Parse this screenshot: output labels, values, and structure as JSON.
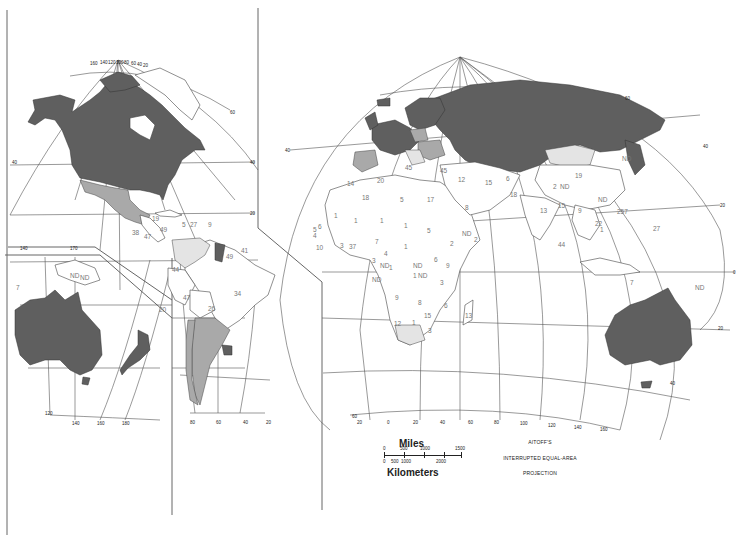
{
  "map": {
    "title_lines": [
      "AITOFF'S",
      "INTERRUPTED EQUAL-AREA",
      "PROJECTION"
    ],
    "scale": {
      "miles_label": "Miles",
      "miles_ticks": [
        "0",
        "500",
        "1000",
        "1500"
      ],
      "km_label": "Kilometers",
      "km_ticks": [
        "0",
        "500",
        "1000",
        "2000"
      ]
    },
    "shading_colors": {
      "dark": "#5f5f5f",
      "medium": "#a9a9a9",
      "light": "#e4e4e4",
      "none": "#ffffff"
    },
    "grid_labels": {
      "americas_top": [
        "160",
        "140",
        "120",
        "100",
        "80",
        "60",
        "40",
        "20"
      ],
      "americas_lat": [
        "60",
        "40",
        "20",
        "0",
        "20",
        "40"
      ],
      "pacific_bottom": [
        "120",
        "140",
        "160",
        "180"
      ],
      "south_america_bottom": [
        "80",
        "60",
        "40",
        "20"
      ],
      "pacific_top": [
        "140",
        "170"
      ],
      "eurasia_bottom": [
        "20",
        "0",
        "20",
        "40",
        "60",
        "80",
        "100",
        "120",
        "140",
        "160"
      ],
      "eurasia_lat": [
        "60",
        "40",
        "20",
        "0",
        "20",
        "40",
        "60"
      ]
    },
    "region_values": {
      "central_america": [
        "19",
        "5",
        "27",
        "9",
        "38",
        "47",
        "49",
        "41",
        "49"
      ],
      "south_america": [
        "44",
        "47",
        "34",
        "26",
        "20"
      ],
      "oceania": [
        "7",
        "ND",
        "ND",
        "20"
      ],
      "europe_med": [
        "45",
        "45",
        "20",
        "14",
        "12",
        "15"
      ],
      "north_africa": [
        "18",
        "5",
        "17",
        "8",
        "1",
        "1",
        "1",
        "1",
        "5",
        "7",
        "1"
      ],
      "west_africa": [
        "5",
        "6",
        "4",
        "10",
        "3",
        "37",
        "3",
        "4",
        "ND",
        "1",
        "ND"
      ],
      "east_africa": [
        "2",
        "ND",
        "2",
        "6",
        "9",
        "ND",
        "1",
        "ND",
        "3"
      ],
      "southern_africa": [
        "9",
        "8",
        "15",
        "6",
        "12",
        "1",
        "13",
        "3"
      ],
      "asia": [
        "19",
        "ND",
        "6",
        "18",
        "2",
        "ND",
        "13",
        "15",
        "9",
        "ND",
        "257",
        "22",
        "27",
        "44",
        "1",
        "7",
        "ND"
      ]
    }
  }
}
